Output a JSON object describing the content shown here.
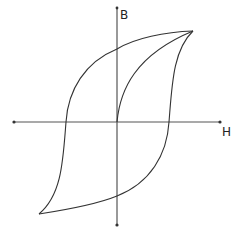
{
  "diagram": {
    "title": "",
    "type": "hysteresis-loop",
    "axes": {
      "x_label": "H",
      "y_label": "B"
    },
    "colors": {
      "axis": "#555555",
      "curve": "#333333",
      "background": "#ffffff"
    },
    "curves": [
      {
        "name": "initial-magnetization-curve"
      },
      {
        "name": "upper-branch"
      },
      {
        "name": "lower-branch"
      }
    ]
  }
}
